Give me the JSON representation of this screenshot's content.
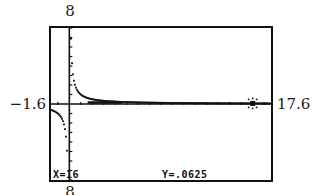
{
  "window": {
    "ymax_label": "8",
    "ymin_label": "8",
    "xmin_label": "−1.6",
    "xmax_label": "17.6"
  },
  "trace": {
    "x_readout": "X=16",
    "y_readout": "Y=.0625"
  },
  "colors": {
    "ink": "#111111",
    "background": "#ffffff"
  },
  "chart_data": {
    "type": "line",
    "title": "",
    "function": "y = 1/x",
    "xlabel": "",
    "ylabel": "",
    "xlim": [
      -1.6,
      17.6
    ],
    "ylim": [
      -8,
      8
    ],
    "xscl": 1,
    "yscl": 1,
    "grid": false,
    "legend": null,
    "trace_point": {
      "x": 16,
      "y": 0.0625
    },
    "annotations": [
      "X=16",
      "Y=.0625"
    ],
    "tick_labels": {
      "xmin": "-1.6",
      "xmax": "17.6",
      "ymin": "8",
      "ymax": "8"
    }
  }
}
